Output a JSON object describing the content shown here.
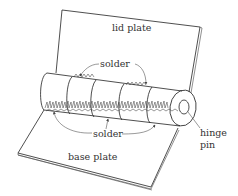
{
  "figure": {
    "labels": {
      "lid_plate": "lid plate",
      "solder_top": "solder",
      "solder_bottom": "solder",
      "hinge_pin_line1": "hinge",
      "hinge_pin_line2": "pin",
      "base_plate": "base plate"
    },
    "colors": {
      "line": "#222222",
      "text": "#333333",
      "background": "#ffffff"
    }
  }
}
